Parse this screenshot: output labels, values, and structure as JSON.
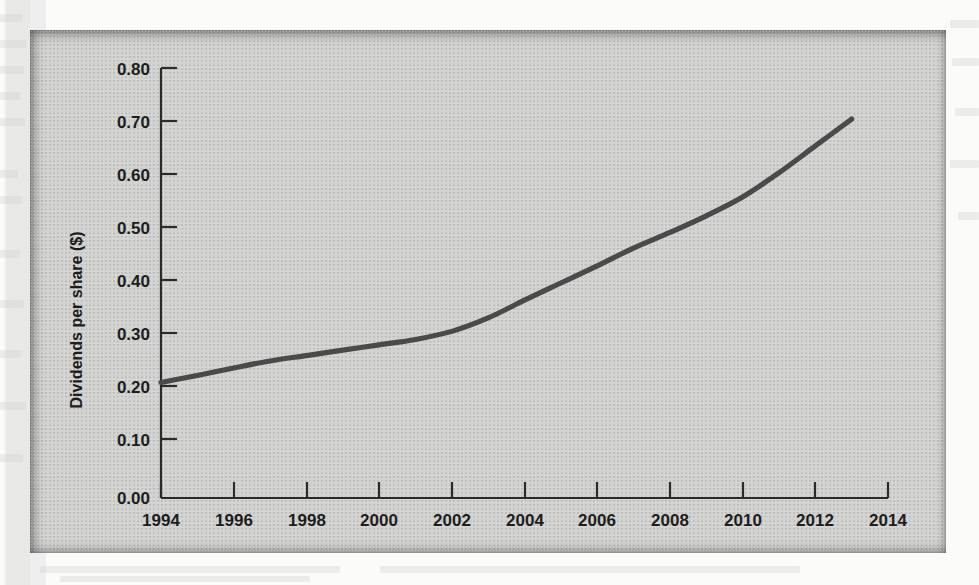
{
  "figure": {
    "panel_background": "#d2d2d0",
    "line_color": "#4a4a4a",
    "axis_color": "#2b2b2b"
  },
  "chart_data": {
    "type": "line",
    "title": "",
    "subtitle": "",
    "xlabel": "",
    "ylabel": "Dividends per share ($)",
    "xlim": [
      1994,
      2014
    ],
    "ylim": [
      0.0,
      0.8
    ],
    "grid": false,
    "legend": null,
    "x_ticks": [
      "1994",
      "1996",
      "1998",
      "2000",
      "2002",
      "2004",
      "2006",
      "2008",
      "2010",
      "2012",
      "2014"
    ],
    "y_ticks": [
      "0.00",
      "0.10",
      "0.20",
      "0.30",
      "0.40",
      "0.50",
      "0.60",
      "0.70",
      "0.80"
    ],
    "series": [
      {
        "name": "Dividends per share",
        "x": [
          1994,
          1995,
          1996,
          1997,
          1998,
          1999,
          2000,
          2001,
          2002,
          2003,
          2004,
          2005,
          2006,
          2007,
          2008,
          2009,
          2010,
          2011,
          2012,
          2013
        ],
        "values": [
          0.215,
          0.228,
          0.242,
          0.255,
          0.265,
          0.275,
          0.285,
          0.295,
          0.31,
          0.335,
          0.368,
          0.4,
          0.432,
          0.465,
          0.494,
          0.525,
          0.56,
          0.605,
          0.655,
          0.705
        ]
      }
    ]
  }
}
